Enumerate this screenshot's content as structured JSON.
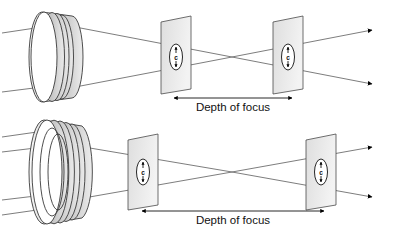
{
  "figure": {
    "background_color": "#ffffff",
    "line_color": "#6e6e6e",
    "lens_fill_light": "#f0f0f0",
    "lens_fill_dark": "#c9c9c9",
    "plane_fill": "#e8e8e8",
    "text_color": "#111111"
  },
  "rows": [
    {
      "id": "row-small-aperture",
      "lens": {
        "name": "small-aperture-lens",
        "center_x": 55,
        "center_y": 57,
        "rx": 13,
        "ry": 45,
        "depth": 33,
        "ring_count": 3
      },
      "incoming_rays": 2,
      "focus_point": {
        "x": 232,
        "y": 57
      },
      "planes": [
        {
          "name": "focal-plane-near",
          "x": 176,
          "y": 57,
          "coc_label": "c",
          "coc_rx": 6.5,
          "coc_ry": 13
        },
        {
          "name": "focal-plane-far",
          "x": 288,
          "y": 57,
          "coc_label": "c",
          "coc_rx": 6.5,
          "coc_ry": 13
        }
      ],
      "dimension": {
        "name": "depth-of-focus-dimension",
        "label": "Depth of focus",
        "x1": 174,
        "x2": 292,
        "y": 98
      }
    },
    {
      "id": "row-large-aperture",
      "lens": {
        "name": "large-aperture-lens",
        "center_x": 57,
        "center_y": 172,
        "rx": 15,
        "ry": 52,
        "depth": 40,
        "ring_count": 4
      },
      "incoming_rays": 4,
      "focus_point": {
        "x": 232,
        "y": 172
      },
      "planes": [
        {
          "name": "focal-plane-near",
          "x": 143,
          "y": 172,
          "coc_label": "c",
          "coc_rx": 6.5,
          "coc_ry": 13
        },
        {
          "name": "focal-plane-far",
          "x": 321,
          "y": 172,
          "coc_label": "c",
          "coc_rx": 6.5,
          "coc_ry": 13
        }
      ],
      "dimension": {
        "name": "depth-of-focus-dimension",
        "label": "Depth of focus",
        "x1": 142,
        "x2": 324,
        "y": 211
      }
    }
  ],
  "labels": {
    "depth_of_focus": "Depth of focus",
    "circle_of_confusion": "c"
  }
}
